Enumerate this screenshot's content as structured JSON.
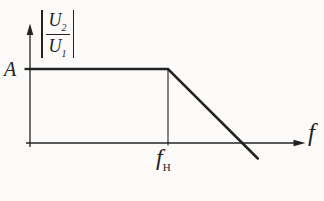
{
  "figure": {
    "background": "#fcfbf9",
    "ink_color": "#222222"
  },
  "labels": {
    "y_axis_quantity": {
      "text": "|U2/U1|",
      "numerator_base": "U",
      "numerator_sub": "2",
      "denominator_base": "U",
      "denominator_sub": "1"
    },
    "y_tick": "A",
    "x_tick": {
      "text": "fH",
      "base": "f",
      "sub": "H"
    },
    "x_axis": "f"
  },
  "chart_data": {
    "type": "line",
    "title": "",
    "xlabel": "f",
    "ylabel": "|U2/U1|",
    "x_tick_labels": [
      "fH"
    ],
    "y_tick_labels": [
      "A"
    ],
    "coords_note": "x is fraction of the drawn f-axis span; y is in units of the plateau level A",
    "series": [
      {
        "name": "magnitude response",
        "points": [
          [
            0,
            1
          ],
          [
            0.515,
            1
          ],
          [
            0.85,
            -0.21
          ]
        ]
      }
    ],
    "guide_line": {
      "x": 0.515,
      "y_from": 1,
      "y_to": 0
    },
    "features": {
      "plateau_level": "A",
      "corner_frequency": "fH",
      "zero_crossing_x": 0.79
    }
  }
}
